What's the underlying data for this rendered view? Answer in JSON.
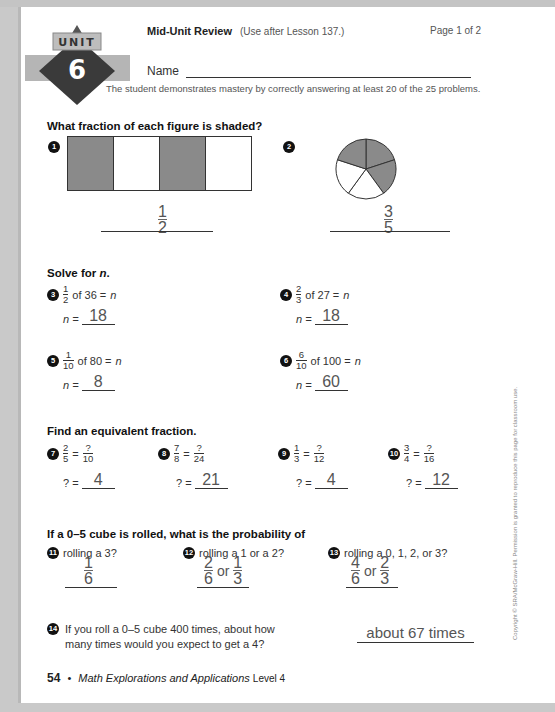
{
  "header": {
    "unit_label": "UNIT",
    "unit_number": "6",
    "title": "Mid-Unit Review",
    "subtitle": "(Use after Lesson 137.)",
    "page_indicator": "Page 1 of 2",
    "name_label": "Name",
    "mastery_note": "The student demonstrates mastery by correctly answering at least 20 of the 25 problems."
  },
  "section1": {
    "heading": "What fraction of each figure is shaded?",
    "problems": [
      {
        "number": "1",
        "figure": "rectangle with 4 parts, parts 1 and 3 shaded",
        "answer_num": "1",
        "answer_den": "2"
      },
      {
        "number": "2",
        "figure": "circle with 5 sectors, 3 shaded",
        "answer_num": "3",
        "answer_den": "5"
      }
    ]
  },
  "section2": {
    "heading_prefix": "Solve for ",
    "heading_var": "n",
    "heading_suffix": ".",
    "problems": [
      {
        "number": "3",
        "num": "1",
        "den": "2",
        "rest": "of 36 =",
        "var": "n",
        "ans_label": "n =",
        "answer": "18"
      },
      {
        "number": "4",
        "num": "2",
        "den": "3",
        "rest": "of 27 =",
        "var": "n",
        "ans_label": "n =",
        "answer": "18"
      },
      {
        "number": "5",
        "num": "1",
        "den": "10",
        "rest": "of 80 =",
        "var": "n",
        "ans_label": "n =",
        "answer": "8"
      },
      {
        "number": "6",
        "num": "6",
        "den": "10",
        "rest": "of 100 =",
        "var": "n",
        "ans_label": "n =",
        "answer": "60"
      }
    ]
  },
  "section3": {
    "heading": "Find an equivalent fraction.",
    "problems": [
      {
        "number": "7",
        "num1": "2",
        "den1": "5",
        "num2": "?",
        "den2": "10",
        "ans_label": "? =",
        "answer": "4"
      },
      {
        "number": "8",
        "num1": "7",
        "den1": "8",
        "num2": "?",
        "den2": "24",
        "ans_label": "? =",
        "answer": "21"
      },
      {
        "number": "9",
        "num1": "1",
        "den1": "3",
        "num2": "?",
        "den2": "12",
        "ans_label": "? =",
        "answer": "4"
      },
      {
        "number": "10",
        "num1": "3",
        "den1": "4",
        "num2": "?",
        "den2": "16",
        "ans_label": "? =",
        "answer": "12"
      }
    ]
  },
  "section4": {
    "heading": "If a 0–5 cube is rolled, what is the probability of",
    "problems": [
      {
        "number": "11",
        "question": "rolling a 3?",
        "a_num": "1",
        "a_den": "6"
      },
      {
        "number": "12",
        "question": "rolling a 1 or a 2?",
        "a_num": "2",
        "a_den": "6",
        "or": "or",
        "b_num": "1",
        "b_den": "3"
      },
      {
        "number": "13",
        "question": "rolling a 0, 1, 2, or 3?",
        "a_num": "4",
        "a_den": "6",
        "or": "or",
        "b_num": "2",
        "b_den": "3"
      }
    ],
    "problem14": {
      "number": "14",
      "question_line1": "If you roll a 0–5 cube 400 times, about how",
      "question_line2": "many times would you expect to get a 4?",
      "answer": "about 67 times"
    }
  },
  "footer": {
    "page_number": "54",
    "bullet": "•",
    "book_title": "Math Explorations and Applications",
    "level": "Level 4"
  },
  "copyright": "Copyright © SRA/McGraw-Hill. Permission is granted to reproduce this page for classroom use.",
  "colors": {
    "shade": "#8a8a8a",
    "badge_gray": "#b5b5b5",
    "badge_dark": "#3a3a3a",
    "ink": "#222222",
    "handwriting": "#555555"
  }
}
